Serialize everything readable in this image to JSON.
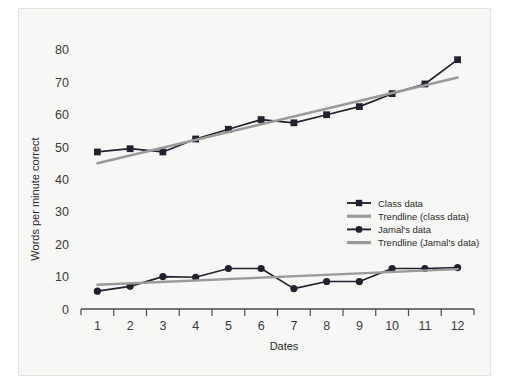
{
  "chart_data": {
    "type": "line",
    "title": "",
    "xlabel": "Dates",
    "ylabel": "Words per minute correct",
    "categories": [
      1,
      2,
      3,
      4,
      5,
      6,
      7,
      8,
      9,
      10,
      11,
      12
    ],
    "xtick_labels": [
      "1",
      "2",
      "3",
      "4",
      "5",
      "6",
      "7",
      "8",
      "9",
      "10",
      "11",
      "12"
    ],
    "ytick_labels": [
      "0",
      "10",
      "20",
      "30",
      "40",
      "50",
      "60",
      "70",
      "80"
    ],
    "yticks": [
      0,
      10,
      20,
      30,
      40,
      50,
      60,
      70,
      80
    ],
    "ylim": [
      0,
      84
    ],
    "xlim": [
      0.5,
      12.5
    ],
    "grid": false,
    "legend_position": "center-right",
    "series": [
      {
        "name": "Class data",
        "kind": "line-markers",
        "marker": "square",
        "color": "#22222e",
        "values": [
          48.5,
          49.5,
          48.5,
          52.5,
          55.5,
          58.5,
          57.5,
          60.0,
          62.5,
          66.5,
          69.5,
          77.0
        ]
      },
      {
        "name": "Trendline (class data)",
        "kind": "trendline",
        "marker": "none",
        "color": "#9a9a9a",
        "endpoints": [
          45.0,
          71.5
        ]
      },
      {
        "name": "Jamal's data",
        "kind": "line-markers",
        "marker": "circle",
        "color": "#22222e",
        "values": [
          5.5,
          7.0,
          10.0,
          9.8,
          12.5,
          12.5,
          6.3,
          8.5,
          8.5,
          12.5,
          12.5,
          12.8
        ]
      },
      {
        "name": "Trendline (Jamal's data)",
        "kind": "trendline",
        "marker": "none",
        "color": "#9a9a9a",
        "endpoints": [
          7.5,
          12.3
        ]
      }
    ],
    "legend_entries": [
      {
        "label": "Class data",
        "swatch": "square-marker-line",
        "color": "#22222e"
      },
      {
        "label": "Trendline (class data)",
        "swatch": "plain-line",
        "color": "#9a9a9a"
      },
      {
        "label": "Jamal's data",
        "swatch": "circle-marker-line",
        "color": "#22222e"
      },
      {
        "label": "Trendline (Jamal's data)",
        "swatch": "plain-line",
        "color": "#9a9a9a"
      }
    ]
  }
}
